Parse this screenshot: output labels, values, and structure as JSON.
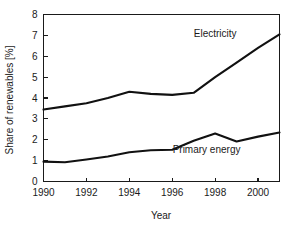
{
  "chart_data": {
    "type": "line",
    "title": "",
    "xlabel": "Year",
    "ylabel": "Share of renewables [%]",
    "xlim": [
      1990,
      2001
    ],
    "ylim": [
      0,
      8
    ],
    "xticks": [
      1990,
      1992,
      1994,
      1996,
      1998,
      2000
    ],
    "xtick_labels": [
      "1990",
      "1992",
      "1994",
      "1996",
      "1998",
      "2000"
    ],
    "yticks": [
      0,
      1,
      2,
      3,
      4,
      5,
      6,
      7,
      8
    ],
    "ytick_labels": [
      "0",
      "1",
      "2",
      "3",
      "4",
      "5",
      "6",
      "7",
      "8"
    ],
    "grid": false,
    "legend_position": "inline-annotation",
    "x": [
      1990,
      1991,
      1992,
      1993,
      1994,
      1995,
      1996,
      1997,
      1998,
      1999,
      2000,
      2001
    ],
    "series": [
      {
        "name": "Electricity",
        "label_x": 1998.0,
        "label_y": 6.9,
        "values": [
          3.45,
          3.6,
          3.75,
          4.0,
          4.3,
          4.2,
          4.15,
          4.25,
          5.0,
          5.7,
          6.4,
          7.05
        ]
      },
      {
        "name": "Primary energy",
        "label_x": 1997.6,
        "label_y": 1.35,
        "values": [
          0.95,
          0.92,
          1.05,
          1.2,
          1.4,
          1.5,
          1.52,
          1.95,
          2.3,
          1.92,
          2.15,
          2.35
        ]
      }
    ]
  },
  "axes": {
    "y_axis_title": "Share of renewables [%]",
    "x_axis_title": "Year"
  },
  "colors": {
    "line": "#111111",
    "axis": "#1a1a1a",
    "background": "#ffffff"
  }
}
